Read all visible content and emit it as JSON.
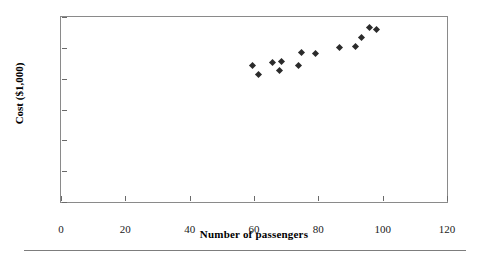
{
  "chart_data": {
    "type": "scatter",
    "title": "",
    "xlabel": "Number of passengers",
    "ylabel": "Cost ($1,000)",
    "xlim": [
      0,
      120
    ],
    "ylim": [
      0,
      6
    ],
    "xticks": [
      0,
      20,
      40,
      60,
      80,
      100,
      120
    ],
    "yticks": [
      0,
      1,
      2,
      3,
      4,
      5,
      6
    ],
    "grid": false,
    "legend": null,
    "marker": "diamond",
    "marker_color": "#2b2b2b",
    "points": [
      {
        "x": 59.4,
        "y": 4.42
      },
      {
        "x": 61.3,
        "y": 4.13
      },
      {
        "x": 65.9,
        "y": 4.52
      },
      {
        "x": 68.7,
        "y": 4.55
      },
      {
        "x": 68.0,
        "y": 4.26
      },
      {
        "x": 73.9,
        "y": 4.42
      },
      {
        "x": 74.9,
        "y": 4.84
      },
      {
        "x": 79.2,
        "y": 4.81
      },
      {
        "x": 86.6,
        "y": 5.0
      },
      {
        "x": 91.6,
        "y": 5.03
      },
      {
        "x": 93.4,
        "y": 5.35
      },
      {
        "x": 95.9,
        "y": 5.67
      },
      {
        "x": 98.0,
        "y": 5.58
      }
    ]
  },
  "figure": {
    "axis_color": "#8a8a8a",
    "tick_color": "#6a6a6a",
    "text_color": "#1a1a1a",
    "background": "#ffffff",
    "rule_color": "#7d7d7d"
  }
}
